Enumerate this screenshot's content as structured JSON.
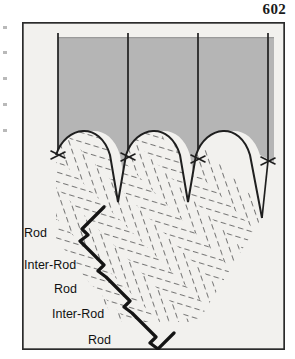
{
  "page": {
    "number": "602"
  },
  "figure": {
    "frame": {
      "x": 22,
      "y": 22,
      "width": 263,
      "height": 328
    },
    "colors": {
      "frame_border": "#2b2b2b",
      "figure_background": "#f2f1ee",
      "gray_block": "#b5b5b5",
      "gray_block_edge": "#9a9a9a",
      "line": "#1f1f1f",
      "hatch": "#4a4a4a",
      "label_text": "#111111"
    },
    "gray_block": {
      "description": "shaded upper region representing bulk enamel above the rod ends",
      "top": 37,
      "left": 58,
      "right": 260
    },
    "rod_path_lines": {
      "description": "four thin vertical lines tracing rod long-axes through the gray block",
      "count": 4,
      "x_positions": [
        56,
        113,
        170,
        227
      ],
      "top": 32,
      "bottom": [
        128,
        130,
        132,
        134
      ]
    },
    "barb_markers": {
      "description": "small X / arrow-barb marks where each rod line meets the enamel surface",
      "count": 4,
      "positions": [
        {
          "x": 56,
          "y": 128
        },
        {
          "x": 113,
          "y": 130
        },
        {
          "x": 170,
          "y": 132
        },
        {
          "x": 227,
          "y": 134
        }
      ]
    },
    "scalloped_surface": {
      "description": "scalloped rod ends: rounded domes separated by sharp V valleys",
      "dome_count": 3,
      "valley_count": 2
    },
    "hatched_region": {
      "description": "short diagonal dashes in alternating bands depicting rod and inter-rod enamel",
      "dash_length": 7,
      "band_count": 14
    },
    "callout_line": {
      "description": "stepped diagonal leader line descending to the lower-left across the rod bands"
    },
    "labels": [
      {
        "text": "Rod",
        "x": 12,
        "y": 232
      },
      {
        "text": "Inter-Rod",
        "x": 12,
        "y": 263
      },
      {
        "text": "Rod",
        "x": 38,
        "y": 285
      },
      {
        "text": "Inter-Rod",
        "x": 42,
        "y": 307
      },
      {
        "text": "Rod",
        "x": 74,
        "y": 331
      }
    ]
  }
}
